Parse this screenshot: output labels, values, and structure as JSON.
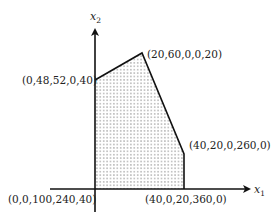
{
  "diagram": {
    "type": "feasible-region",
    "axes": {
      "x": {
        "label": "x",
        "subscript": "1"
      },
      "y": {
        "label": "x",
        "subscript": "2"
      }
    },
    "vertices": [
      {
        "id": "origin",
        "label": "(0,0,100,240,40)"
      },
      {
        "id": "left-top",
        "label": "(0,48,52,0,40)"
      },
      {
        "id": "top",
        "label": "(20,60,0,0,20)"
      },
      {
        "id": "right-upper",
        "label": "(40,20,0,260,0)"
      },
      {
        "id": "right-lower",
        "label": "(40,0,20,360,0)"
      }
    ],
    "colors": {
      "line": "#111111",
      "dots": "#555555",
      "text": "#222222"
    }
  }
}
